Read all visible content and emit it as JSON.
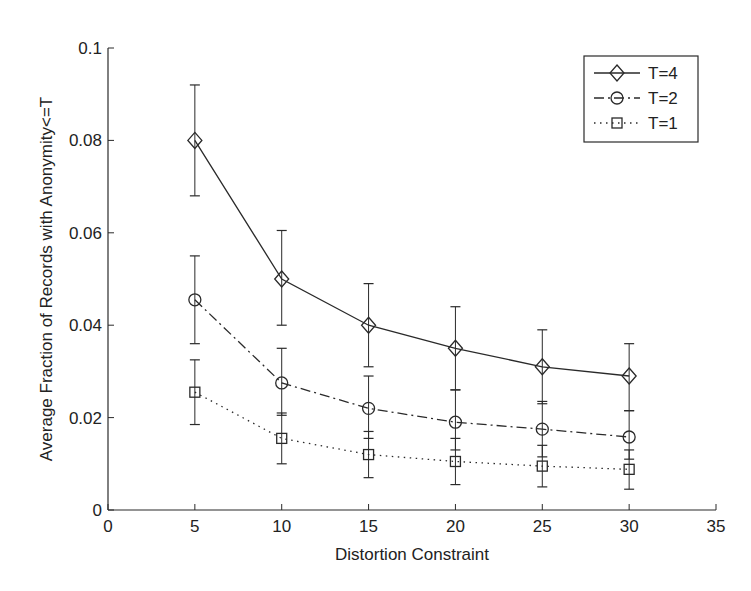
{
  "chart_data": {
    "type": "line",
    "title": "",
    "xlabel": "Distortion Constraint",
    "ylabel": "Average Fraction of Records with Anonymity<=T",
    "xlim": [
      0,
      35
    ],
    "ylim": [
      0,
      0.1
    ],
    "xticks": [
      0,
      5,
      10,
      15,
      20,
      25,
      30,
      35
    ],
    "yticks": [
      0,
      0.02,
      0.04,
      0.06,
      0.08,
      0.1
    ],
    "xtick_labels": [
      "0",
      "5",
      "10",
      "15",
      "20",
      "25",
      "30",
      "35"
    ],
    "ytick_labels": [
      "0",
      "0.02",
      "0.04",
      "0.06",
      "0.08",
      "0.1"
    ],
    "grid": false,
    "legend_position": "upper right",
    "x": [
      5,
      10,
      15,
      20,
      25,
      30
    ],
    "series": [
      {
        "name": "T=4",
        "marker": "diamond",
        "linestyle": "solid",
        "values": [
          0.08,
          0.05,
          0.04,
          0.035,
          0.031,
          0.029
        ],
        "error_lower": [
          0.068,
          0.04,
          0.031,
          0.026,
          0.023,
          0.0215
        ],
        "error_upper": [
          0.092,
          0.0605,
          0.049,
          0.044,
          0.039,
          0.036
        ]
      },
      {
        "name": "T=2",
        "marker": "circle",
        "linestyle": "dashdot",
        "values": [
          0.0455,
          0.0275,
          0.022,
          0.019,
          0.0175,
          0.0158
        ],
        "error_lower": [
          0.036,
          0.0205,
          0.0155,
          0.013,
          0.0115,
          0.011
        ],
        "error_upper": [
          0.055,
          0.035,
          0.029,
          0.026,
          0.0235,
          0.0215
        ]
      },
      {
        "name": "T=1",
        "marker": "square",
        "linestyle": "dotted",
        "values": [
          0.0255,
          0.0155,
          0.012,
          0.0105,
          0.0095,
          0.0088
        ],
        "error_lower": [
          0.0185,
          0.01,
          0.007,
          0.0055,
          0.005,
          0.0045
        ],
        "error_upper": [
          0.0325,
          0.021,
          0.017,
          0.0155,
          0.014,
          0.013
        ]
      }
    ]
  },
  "colors": {
    "line": "#2a2a2a",
    "background": "#ffffff"
  }
}
